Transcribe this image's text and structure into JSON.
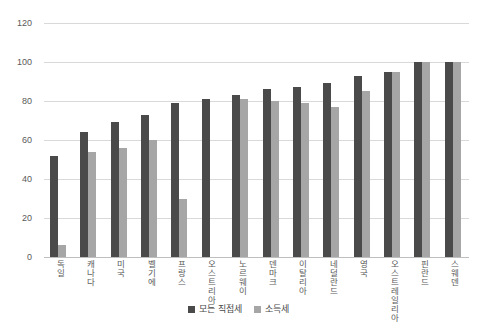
{
  "chart_data": {
    "type": "bar",
    "title": "",
    "xlabel": "",
    "ylabel": "",
    "ylim": [
      0,
      120
    ],
    "yticks": [
      0,
      20,
      40,
      60,
      80,
      100,
      120
    ],
    "grid": true,
    "legend_position": "bottom",
    "categories": [
      "독일",
      "캐나다",
      "미국",
      "벨기에",
      "프랑스",
      "오스트리아",
      "노르웨이",
      "덴마크",
      "이탈리아",
      "네덜란드",
      "영국",
      "오스트레일리아",
      "핀란드",
      "스웨덴"
    ],
    "series": [
      {
        "name": "모든 직접세",
        "color": "#4a4a4a",
        "values": [
          52,
          64,
          69,
          73,
          79,
          81,
          83,
          86,
          87,
          89,
          93,
          95,
          100,
          100
        ]
      },
      {
        "name": "소득세",
        "color": "#a6a6a6",
        "values": [
          6,
          54,
          56,
          60,
          30,
          0,
          81,
          80,
          79,
          77,
          85,
          95,
          100,
          100
        ]
      }
    ]
  },
  "axis": {
    "y_tick_labels": [
      "0",
      "20",
      "40",
      "60",
      "80",
      "100",
      "120"
    ]
  },
  "legend": {
    "items": [
      {
        "label": "모든 직접세",
        "swatch": "legend-swatch-dark"
      },
      {
        "label": "소득세",
        "swatch": "legend-swatch-light"
      }
    ]
  },
  "colors": {
    "series_all_direct_tax": "#4a4a4a",
    "series_income_tax": "#a6a6a6",
    "gridline": "#d9d9d9",
    "axis": "#bfbfbf",
    "text": "#5a5a5a",
    "background": "#ffffff"
  }
}
